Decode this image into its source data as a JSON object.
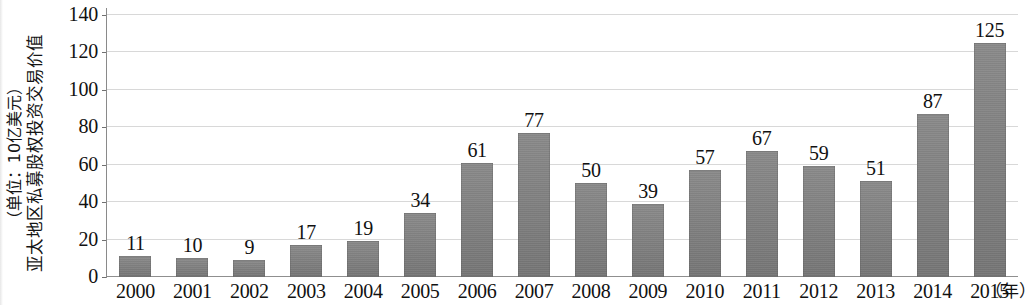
{
  "chart_data": {
    "type": "bar",
    "title": "",
    "ylabel": "亚太地区私募股权投资交易价值",
    "ylabel_unit": "（单位：10亿美元）",
    "xlabel": "",
    "xunit": "（年）",
    "categories": [
      "2000",
      "2001",
      "2002",
      "2003",
      "2004",
      "2005",
      "2006",
      "2007",
      "2008",
      "2009",
      "2010",
      "2011",
      "2012",
      "2013",
      "2014",
      "2015"
    ],
    "values": [
      11,
      10,
      9,
      17,
      19,
      34,
      61,
      77,
      50,
      39,
      57,
      67,
      59,
      51,
      87,
      125
    ],
    "ylim": [
      0,
      140
    ],
    "ytick_labels": [
      "0",
      "20",
      "40",
      "60",
      "80",
      "100",
      "120",
      "140"
    ],
    "ytick_values": [
      0,
      20,
      40,
      60,
      80,
      100,
      120,
      140
    ],
    "grid": true,
    "legend": false,
    "bar_color": "#7c7c7c",
    "grid_color": "#d8d8d8",
    "axis_color": "#8a8a8a",
    "text_color": "#111111"
  }
}
